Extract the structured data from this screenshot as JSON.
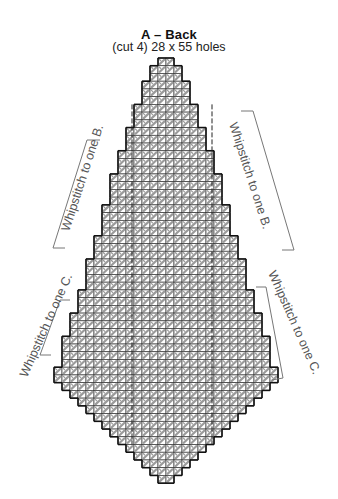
{
  "header": {
    "title": "A – Back",
    "subtitle": "(cut 4) 28 x 55 holes"
  },
  "grid": {
    "cols": 28,
    "rows": 55,
    "origin_x": 54,
    "origin_y": 58,
    "cell_w": 8,
    "cell_h": 7.73,
    "row_widths": [
      2,
      4,
      4,
      6,
      6,
      6,
      8,
      8,
      8,
      10,
      10,
      10,
      12,
      12,
      12,
      14,
      14,
      14,
      14,
      16,
      16,
      16,
      16,
      18,
      18,
      18,
      20,
      20,
      20,
      20,
      22,
      22,
      22,
      24,
      24,
      24,
      26,
      26,
      26,
      26,
      28,
      28,
      26,
      24,
      22,
      20,
      18,
      16,
      14,
      12,
      10,
      8,
      6,
      4,
      2
    ],
    "colors": {
      "outline": "#111111",
      "grid": "#333333",
      "fill": "#bdbdbd",
      "stitch": "#9a9a9a",
      "bracket": "#666666"
    }
  },
  "annotations": [
    {
      "id": "left-b",
      "text": "Whipstitch to one B."
    },
    {
      "id": "right-b",
      "text": "Whipstitch to one B."
    },
    {
      "id": "left-c",
      "text": "Whipstitch to one C."
    },
    {
      "id": "right-c",
      "text": "Whipstitch to one C."
    }
  ]
}
